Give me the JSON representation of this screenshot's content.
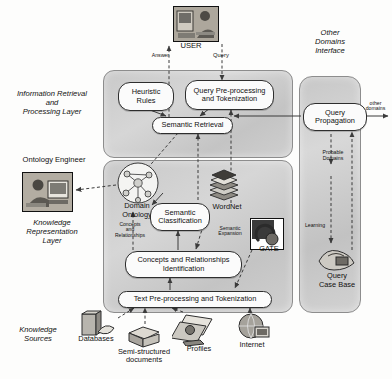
{
  "figure": {
    "type": "system-architecture-diagram"
  },
  "actors": {
    "user": {
      "label": "USER",
      "icon": "user-at-computer-photo"
    },
    "ontology_engineer": {
      "label": "Ontology Engineer",
      "icon": "engineer-at-computer-photo"
    }
  },
  "layers": [
    {
      "id": "ir",
      "label": "Information Retrieval\nand\nProcessing Layer",
      "line1": "Information Retrieval",
      "line2": "and",
      "line3": "Processing Layer"
    },
    {
      "id": "kr",
      "label": "Knowledge Representation Layer",
      "line1": "Knowledge",
      "line2": "Representation",
      "line3": "Layer"
    }
  ],
  "other_domains_interface": {
    "line1": "Other",
    "line2": "Domains",
    "line3": "Interface",
    "nodes": [
      {
        "id": "query-propagation",
        "line1": "Query",
        "line2": "Propagation"
      }
    ],
    "annotations": {
      "probable_domains_1": "Probable",
      "probable_domains_2": "Domains",
      "learning": "Learning",
      "other_domains_1": "other",
      "other_domains_2": "domains"
    },
    "case_base": {
      "line1": "Query",
      "line2": "Case Base",
      "icon": "case-base-photo"
    }
  },
  "nodes": {
    "heuristic_rules": {
      "line1": "Heuristic",
      "line2": "Rules"
    },
    "query_preprocessing": {
      "line1": "Query Pre-processing",
      "line2": "and Tokenization"
    },
    "semantic_retrieval": {
      "line1": "Semantic Retrieval"
    },
    "semantic_classification": {
      "line1": "Semantic",
      "line2": "Classification"
    },
    "concepts_identification": {
      "line1": "Concepts and Relationships",
      "line2": "Identification"
    },
    "text_preprocessing": {
      "line1": "Text Pre-processing and Tokenization"
    }
  },
  "resources": {
    "domain_ontology": {
      "line1": "Domain",
      "line2": "Ontology",
      "icon": "ontology-graph-icon"
    },
    "wordnet": {
      "label": "WordNet",
      "icon": "book-stack-icon"
    },
    "gate": {
      "label": "GATE",
      "icon": "gate-tool-photo"
    }
  },
  "edge_labels": {
    "answer": "Answer",
    "query": "Query",
    "concepts_and_relationships_1": "Concepts",
    "concepts_and_relationships_2": "and",
    "concepts_and_relationships_3": "Relationships",
    "semantic_expansion_1": "Semantic",
    "semantic_expansion_2": "Expansion"
  },
  "knowledge_sources": {
    "group_label_1": "Knowledge",
    "group_label_2": "Sources",
    "items": [
      {
        "label": "Databases",
        "icon": "database-icon"
      },
      {
        "line1": "Semi-structured",
        "line2": "documents",
        "icon": "documents-icon"
      },
      {
        "label": "Profiles",
        "icon": "profiles-icon"
      },
      {
        "label": "Internet",
        "icon": "internet-globe-icon"
      }
    ]
  }
}
